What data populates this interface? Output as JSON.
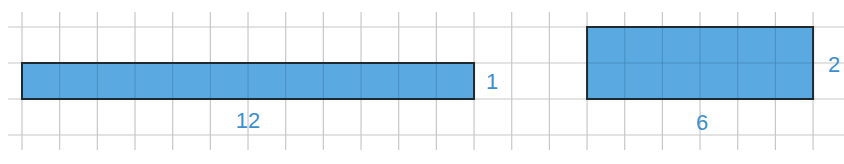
{
  "diagram": {
    "type": "area-rectangles-on-grid",
    "grid": {
      "line_color": "#c8c8c8",
      "cell_size_px": 37.67,
      "origin_x": 22,
      "columns": 22,
      "rows_y": [
        27,
        63,
        99,
        135
      ],
      "v_top": 12,
      "v_bottom": 150
    },
    "colors": {
      "fill": "#5aa9e0",
      "stroke": "#1f2a30",
      "label": "#3b8fcf"
    },
    "shapes": [
      {
        "id": "rect-12x1",
        "width_units": 12,
        "height_units": 1,
        "col": 0,
        "row_top": 1,
        "width_label": "12",
        "height_label": "1"
      },
      {
        "id": "rect-6x2",
        "width_units": 6,
        "height_units": 2,
        "col": 15,
        "row_top": 0,
        "width_label": "6",
        "height_label": "2"
      }
    ]
  }
}
